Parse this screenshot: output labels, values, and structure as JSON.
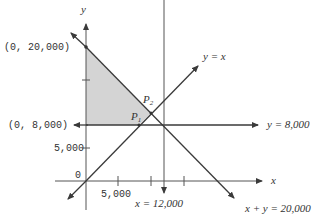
{
  "diagram": {
    "type": "linear-programming-feasible-region",
    "axes": {
      "x_label": "x",
      "y_label": "y",
      "origin_label": "0",
      "x_tick_label": "5,000",
      "y_tick_label": "5,000"
    },
    "points": {
      "y_intercept_label": "(0, 20,000)",
      "y8000_intercept_label": "(0, 8,000)",
      "p1_label": "P",
      "p1_sub": "1",
      "p2_label": "P",
      "p2_sub": "2"
    },
    "lines": {
      "y_eq_x": "y = x",
      "y_eq_8000": "y = 8,000",
      "x_eq_12000": "x = 12,000",
      "x_plus_y": "x + y = 20,000"
    },
    "colors": {
      "line": "#3a3a3a",
      "shade": "#d4d4d4",
      "text": "#333333"
    }
  }
}
